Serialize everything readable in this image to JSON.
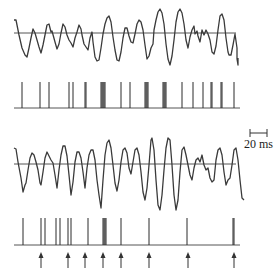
{
  "figure": {
    "scale_bar": {
      "label": "20 ms"
    },
    "colors": {
      "trace": "#3a3a3a",
      "baseline": "#555555",
      "spike": "#2a2a2a",
      "arrow": "#333333"
    }
  },
  "chart_data": [
    {
      "type": "line",
      "title": "Panel A: stimulus waveform with threshold line",
      "xlabel": "",
      "ylabel": "",
      "grid": false,
      "baseline_y": 33,
      "x_range": [
        14,
        238
      ],
      "points": [
        [
          14,
          20
        ],
        [
          16,
          20
        ],
        [
          19,
          35
        ],
        [
          22,
          48
        ],
        [
          25,
          55
        ],
        [
          27,
          57
        ],
        [
          29,
          48
        ],
        [
          31,
          38
        ],
        [
          33,
          29
        ],
        [
          35,
          33
        ],
        [
          37,
          40
        ],
        [
          39,
          47
        ],
        [
          41,
          53
        ],
        [
          43,
          45
        ],
        [
          45,
          35
        ],
        [
          47,
          25
        ],
        [
          49,
          24
        ],
        [
          51,
          32
        ],
        [
          52,
          31
        ],
        [
          55,
          42
        ],
        [
          57,
          49
        ],
        [
          59,
          44
        ],
        [
          61,
          33
        ],
        [
          63,
          24
        ],
        [
          65,
          27
        ],
        [
          67,
          35
        ],
        [
          69,
          40
        ],
        [
          71,
          43
        ],
        [
          73,
          47
        ],
        [
          75,
          38
        ],
        [
          77,
          32
        ],
        [
          79,
          25
        ],
        [
          81,
          29
        ],
        [
          82,
          35
        ],
        [
          84,
          44
        ],
        [
          86,
          47
        ],
        [
          88,
          50
        ],
        [
          90,
          38
        ],
        [
          92,
          32
        ],
        [
          93,
          42
        ],
        [
          95,
          57
        ],
        [
          97,
          61
        ],
        [
          99,
          60
        ],
        [
          101,
          48
        ],
        [
          103,
          34
        ],
        [
          105,
          24
        ],
        [
          107,
          18
        ],
        [
          109,
          16
        ],
        [
          111,
          22
        ],
        [
          113,
          37
        ],
        [
          115,
          50
        ],
        [
          117,
          60
        ],
        [
          119,
          61
        ],
        [
          121,
          52
        ],
        [
          123,
          38
        ],
        [
          125,
          28
        ],
        [
          127,
          28
        ],
        [
          129,
          36
        ],
        [
          131,
          42
        ],
        [
          133,
          43
        ],
        [
          135,
          34
        ],
        [
          137,
          24
        ],
        [
          139,
          20
        ],
        [
          141,
          22
        ],
        [
          143,
          30
        ],
        [
          145,
          45
        ],
        [
          147,
          59
        ],
        [
          149,
          56
        ],
        [
          151,
          48
        ],
        [
          153,
          44
        ],
        [
          154,
          30
        ],
        [
          156,
          20
        ],
        [
          158,
          12
        ],
        [
          160,
          9
        ],
        [
          162,
          13
        ],
        [
          164,
          24
        ],
        [
          166,
          44
        ],
        [
          168,
          59
        ],
        [
          170,
          65
        ],
        [
          172,
          56
        ],
        [
          174,
          40
        ],
        [
          176,
          22
        ],
        [
          178,
          12
        ],
        [
          180,
          9
        ],
        [
          182,
          13
        ],
        [
          184,
          24
        ],
        [
          186,
          40
        ],
        [
          188,
          48
        ],
        [
          190,
          37
        ],
        [
          192,
          30
        ],
        [
          194,
          26
        ],
        [
          195,
          34
        ],
        [
          197,
          31
        ],
        [
          198,
          36
        ],
        [
          200,
          42
        ],
        [
          202,
          30
        ],
        [
          204,
          35
        ],
        [
          206,
          30
        ],
        [
          208,
          34
        ],
        [
          210,
          40
        ],
        [
          212,
          52
        ],
        [
          214,
          54
        ],
        [
          216,
          46
        ],
        [
          218,
          30
        ],
        [
          220,
          16
        ],
        [
          222,
          14
        ],
        [
          224,
          20
        ],
        [
          226,
          38
        ],
        [
          228,
          52
        ],
        [
          229,
          55
        ],
        [
          231,
          55
        ],
        [
          233,
          45
        ],
        [
          235,
          34
        ],
        [
          237,
          48
        ],
        [
          237,
          59
        ],
        [
          238,
          65
        ],
        [
          238,
          58
        ]
      ]
    },
    {
      "type": "table",
      "title": "Panel A: spike raster (x positions, px)",
      "baseline_y": 108,
      "spike_top_y": 82,
      "spikes_x": [
        22,
        40,
        49,
        69,
        73,
        85,
        86,
        101,
        102,
        103,
        104,
        105,
        121,
        130,
        145,
        146,
        147,
        148,
        163,
        164,
        165,
        166,
        182,
        193,
        203,
        211,
        212,
        221,
        222,
        234
      ]
    },
    {
      "type": "line",
      "title": "Panel B: stimulus waveform with threshold line",
      "xlabel": "",
      "ylabel": "",
      "grid": false,
      "baseline_y": 164,
      "x_range": [
        14,
        238
      ],
      "points": [
        [
          14,
          148
        ],
        [
          16,
          149
        ],
        [
          18,
          162
        ],
        [
          21,
          178
        ],
        [
          23,
          192
        ],
        [
          25,
          185
        ],
        [
          26,
          183
        ],
        [
          28,
          170
        ],
        [
          30,
          158
        ],
        [
          32,
          153
        ],
        [
          34,
          155
        ],
        [
          36,
          162
        ],
        [
          38,
          170
        ],
        [
          40,
          183
        ],
        [
          41,
          185
        ],
        [
          43,
          172
        ],
        [
          45,
          158
        ],
        [
          47,
          152
        ],
        [
          49,
          156
        ],
        [
          51,
          160
        ],
        [
          53,
          163
        ],
        [
          55,
          175
        ],
        [
          57,
          188
        ],
        [
          59,
          170
        ],
        [
          61,
          155
        ],
        [
          63,
          146
        ],
        [
          65,
          146
        ],
        [
          67,
          156
        ],
        [
          69,
          175
        ],
        [
          71,
          195
        ],
        [
          73,
          182
        ],
        [
          75,
          162
        ],
        [
          77,
          152
        ],
        [
          79,
          152
        ],
        [
          81,
          158
        ],
        [
          83,
          172
        ],
        [
          85,
          188
        ],
        [
          87,
          168
        ],
        [
          89,
          155
        ],
        [
          91,
          150
        ],
        [
          93,
          150
        ],
        [
          95,
          160
        ],
        [
          97,
          180
        ],
        [
          99,
          195
        ],
        [
          101,
          208
        ],
        [
          103,
          180
        ],
        [
          105,
          155
        ],
        [
          107,
          143
        ],
        [
          109,
          140
        ],
        [
          111,
          148
        ],
        [
          113,
          165
        ],
        [
          115,
          183
        ],
        [
          117,
          191
        ],
        [
          119,
          180
        ],
        [
          121,
          162
        ],
        [
          123,
          150
        ],
        [
          125,
          148
        ],
        [
          127,
          153
        ],
        [
          129,
          168
        ],
        [
          131,
          174
        ],
        [
          133,
          162
        ],
        [
          135,
          150
        ],
        [
          137,
          148
        ],
        [
          139,
          155
        ],
        [
          141,
          172
        ],
        [
          143,
          192
        ],
        [
          145,
          200
        ],
        [
          147,
          188
        ],
        [
          149,
          165
        ],
        [
          151,
          140
        ],
        [
          152,
          138
        ],
        [
          154,
          150
        ],
        [
          156,
          180
        ],
        [
          158,
          205
        ],
        [
          160,
          210
        ],
        [
          162,
          195
        ],
        [
          164,
          170
        ],
        [
          166,
          148
        ],
        [
          168,
          138
        ],
        [
          170,
          140
        ],
        [
          172,
          165
        ],
        [
          174,
          195
        ],
        [
          176,
          210
        ],
        [
          178,
          200
        ],
        [
          180,
          172
        ],
        [
          182,
          150
        ],
        [
          184,
          147
        ],
        [
          186,
          155
        ],
        [
          188,
          165
        ],
        [
          190,
          175
        ],
        [
          192,
          180
        ],
        [
          194,
          168
        ],
        [
          196,
          160
        ],
        [
          198,
          158
        ],
        [
          200,
          162
        ],
        [
          202,
          155
        ],
        [
          204,
          165
        ],
        [
          206,
          170
        ],
        [
          208,
          168
        ],
        [
          210,
          178
        ],
        [
          212,
          182
        ],
        [
          214,
          180
        ],
        [
          216,
          160
        ],
        [
          218,
          150
        ],
        [
          220,
          148
        ],
        [
          222,
          155
        ],
        [
          224,
          172
        ],
        [
          226,
          185
        ],
        [
          228,
          180
        ],
        [
          230,
          178
        ],
        [
          232,
          165
        ],
        [
          234,
          150
        ],
        [
          236,
          148
        ],
        [
          238,
          160
        ],
        [
          240,
          180
        ],
        [
          242,
          198
        ],
        [
          244,
          200
        ]
      ]
    },
    {
      "type": "table",
      "title": "Panel B: spike raster (x positions, px) with stimulus-event arrows",
      "baseline_y": 245,
      "spike_top_y": 218,
      "spikes_x": [
        23,
        41,
        45,
        56,
        60,
        68,
        71,
        88,
        103,
        104,
        105,
        106,
        121,
        149,
        187,
        233,
        234
      ],
      "arrows_x": [
        41,
        68,
        85,
        103,
        121,
        149,
        188,
        234
      ]
    }
  ]
}
